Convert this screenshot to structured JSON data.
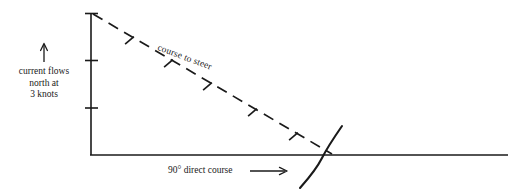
{
  "diagram": {
    "stroke_color": "#1a1a1a",
    "background_color": "#ffffff",
    "labels": {
      "current_line1": "current flows",
      "current_line2": "north at",
      "current_line3": "3 knots",
      "direct_course": "90° direct course",
      "course_to_steer": "course to steer"
    },
    "vectors": {
      "current": {
        "name": "current vector",
        "orientation": "vertical",
        "direction": "north",
        "magnitude": "3",
        "units": "knots",
        "tick_count": 3
      },
      "direct_course": {
        "name": "direct course vector",
        "orientation": "horizontal",
        "bearing": "90°",
        "arrow": "right"
      },
      "course_to_steer": {
        "name": "course to steer vector",
        "style": "dashed",
        "tick_count": 3
      },
      "speed_arc": {
        "name": "boat speed arc",
        "style": "solid curve"
      }
    }
  }
}
